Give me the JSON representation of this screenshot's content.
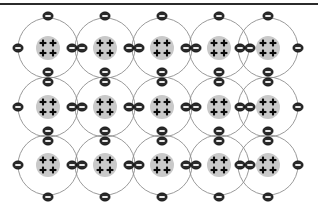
{
  "diagram": {
    "width": 318,
    "height": 209,
    "background_color": "#ffffff",
    "top_rule": {
      "label": "top-border-rule",
      "color": "#2b2b2b",
      "y": 3,
      "thickness": 2
    },
    "grid": {
      "columns": 5,
      "rows": 3,
      "column_centers_x": [
        48,
        105,
        162,
        219,
        268
      ],
      "row_centers_y": [
        48,
        107,
        165
      ],
      "column_spacing": 57,
      "row_spacing": 58
    },
    "atom": {
      "label": "atom",
      "proton_count": 4,
      "proton_symbol": "+",
      "proton_layout": "2x2",
      "nucleus": {
        "label": "nucleus",
        "radius": 12,
        "fill_color": "#c9c9c9"
      },
      "shell": {
        "label": "electron-shell",
        "radius": 30,
        "stroke_color": "#8f8f8f",
        "stroke_width": 0.9
      }
    },
    "electron": {
      "label": "electron",
      "charge_symbol": "-",
      "rx": 5.2,
      "ry": 4.2,
      "fill_color": "#2a2a2a",
      "bar_color": "#ffffff"
    },
    "electron_positions": {
      "top_row_single_y": 16,
      "bottom_row_single_y": 197,
      "left_single_x": 18,
      "right_single_x": 298,
      "pair_offset": 5,
      "pair_columns_x": [
        77,
        134,
        191,
        245
      ],
      "pair_rows_y": [
        77,
        136
      ]
    },
    "legend": {
      "proton_label": "proton (+)",
      "electron_label": "electron (-)",
      "nucleus_label": "nucleus",
      "shell_label": "electron shell"
    }
  }
}
